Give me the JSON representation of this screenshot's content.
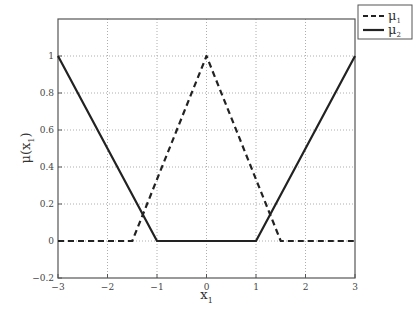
{
  "chart_data": {
    "type": "line",
    "title": "",
    "xlabel": "x_1",
    "ylabel": "μ(x_1)",
    "xlim": [
      -3,
      3
    ],
    "ylim": [
      -0.2,
      1.2
    ],
    "grid": true,
    "legend_position": "outside-top-right",
    "xticks": [
      -3,
      -2,
      -1,
      0,
      1,
      2,
      3
    ],
    "yticks": [
      -0.2,
      0,
      0.2,
      0.4,
      0.6,
      0.8,
      1
    ],
    "series": [
      {
        "name": "μ_1",
        "style": "dashed",
        "x": [
          -3,
          -1.5,
          0,
          1.5,
          3
        ],
        "y": [
          0,
          0,
          1,
          0,
          0
        ]
      },
      {
        "name": "μ_2",
        "style": "solid",
        "x": [
          -3,
          -1,
          1,
          3
        ],
        "y": [
          1,
          0,
          0,
          1
        ]
      }
    ]
  },
  "labels": {
    "xlabel_main": "x",
    "xlabel_sub": "1",
    "ylabel_main": "μ(x",
    "ylabel_sub": "1",
    "ylabel_close": ")",
    "legend": [
      {
        "main": "μ",
        "sub": "1"
      },
      {
        "main": "μ",
        "sub": "2"
      }
    ],
    "xtick_labels": [
      "−3",
      "−2",
      "−1",
      "0",
      "1",
      "2",
      "3"
    ],
    "ytick_labels": [
      "−0.2",
      "0",
      "0.2",
      "0.4",
      "0.6",
      "0.8",
      "1"
    ]
  }
}
